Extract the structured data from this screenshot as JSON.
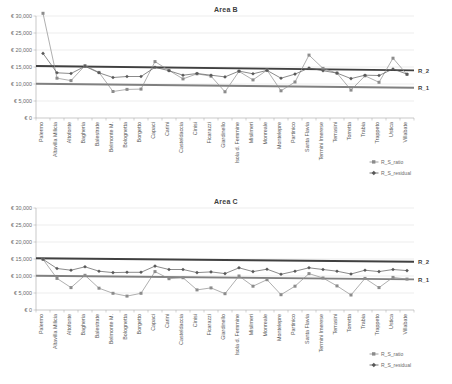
{
  "charts": [
    {
      "title": "Area B",
      "legend": [
        {
          "name": "R_S_ratio",
          "marker": "square-marker-icon",
          "color": "#8c8c8c"
        },
        {
          "name": "R_S_residual",
          "marker": "diamond-marker-icon",
          "color": "#595959"
        }
      ],
      "ref_labels": {
        "upper": "R_2",
        "lower": "R_1"
      }
    },
    {
      "title": "Area C",
      "legend": [
        {
          "name": "R_S_ratio",
          "marker": "square-marker-icon",
          "color": "#8c8c8c"
        },
        {
          "name": "R_S_residual",
          "marker": "diamond-marker-icon",
          "color": "#595959"
        }
      ],
      "ref_labels": {
        "upper": "R_2",
        "lower": "R_1"
      }
    }
  ],
  "chart_data": [
    {
      "type": "line",
      "title": "Area B",
      "xlabel": "",
      "ylabel": "",
      "ylim": [
        0,
        30000
      ],
      "yticks": [
        0,
        5000,
        10000,
        15000,
        20000,
        25000,
        30000
      ],
      "ytick_labels": [
        "€ 0",
        "€ 5,000",
        "€ 10,000",
        "€ 15,000",
        "€ 20,000",
        "€ 25,000",
        "€ 30,000"
      ],
      "grid": true,
      "legend_position": "bottom-right",
      "categories": [
        "Palermo",
        "Altavilla Milicia",
        "Altofonte",
        "Bagheria",
        "Balestrate",
        "Belmonte M.",
        "Bolognetta",
        "Borgetto",
        "Capaci",
        "Carini",
        "Casteldaccia",
        "Cinisi",
        "Ficarazzi",
        "Giardinello",
        "Isola d. Femmine",
        "Misilmeri",
        "Monreale",
        "Montelepre",
        "Partinico",
        "Santa Flavia",
        "Termini Imerese",
        "Terrasini",
        "Torretta",
        "Trabia",
        "Trappeto",
        "Ustica",
        "Villabate"
      ],
      "series": [
        {
          "name": "R_S_ratio",
          "color": "#8c8c8c",
          "values": [
            30800,
            11700,
            11000,
            15400,
            13400,
            7800,
            8400,
            8500,
            16600,
            14000,
            11500,
            13000,
            12300,
            7700,
            13700,
            11200,
            14100,
            8000,
            10600,
            18500,
            14600,
            13200,
            8200,
            12400,
            10500,
            17600,
            12800
          ]
        },
        {
          "name": "R_S_residual",
          "color": "#595959",
          "values": [
            19000,
            13300,
            13100,
            15200,
            13300,
            11900,
            12200,
            12200,
            14900,
            13900,
            12600,
            13100,
            12600,
            12100,
            13800,
            13000,
            14000,
            11700,
            12900,
            14700,
            13900,
            13200,
            11600,
            12600,
            12500,
            14400,
            12900
          ]
        }
      ],
      "reference_lines": [
        {
          "name": "R_2",
          "color": "#404040",
          "start": 15300,
          "end": 14000
        },
        {
          "name": "R_1",
          "color": "#808080",
          "start": 10100,
          "end": 8900
        }
      ]
    },
    {
      "type": "line",
      "title": "Area C",
      "xlabel": "",
      "ylabel": "",
      "ylim": [
        0,
        30000
      ],
      "yticks": [
        0,
        5000,
        10000,
        15000,
        20000,
        25000,
        30000
      ],
      "ytick_labels": [
        "€ 0",
        "€ 5,000",
        "€ 10,000",
        "€ 15,000",
        "€ 20,000",
        "€ 25,000",
        "€ 30,000"
      ],
      "grid": true,
      "legend_position": "bottom-right",
      "categories": [
        "Palermo",
        "Altavilla Milicia",
        "Altofonte",
        "Bagheria",
        "Balestrate",
        "Belmonte M.",
        "Bolognetta",
        "Borgetto",
        "Capaci",
        "Carini",
        "Casteldaccia",
        "Cinisi",
        "Ficarazzi",
        "Giardinello",
        "Isola d. Femmine",
        "Misilmeri",
        "Monreale",
        "Montelepre",
        "Partinico",
        "Santa Flavia",
        "Termini Imerese",
        "Terrasini",
        "Torretta",
        "Trabia",
        "Trappeto",
        "Ustica",
        "Villabate"
      ],
      "series": [
        {
          "name": "R_S_ratio",
          "color": "#8c8c8c",
          "values": [
            14900,
            9300,
            6600,
            10200,
            6400,
            4900,
            4100,
            4900,
            11300,
            9200,
            9500,
            5900,
            6500,
            4800,
            10000,
            7000,
            8900,
            4500,
            7000,
            10700,
            9400,
            7100,
            4400,
            9300,
            6600,
            9600,
            9100
          ]
        },
        {
          "name": "R_S_residual",
          "color": "#595959",
          "values": [
            14900,
            12200,
            11700,
            12700,
            11400,
            11000,
            11100,
            11100,
            12900,
            11900,
            11900,
            11000,
            11200,
            10700,
            12400,
            11300,
            12000,
            10500,
            11400,
            12400,
            11900,
            11400,
            10600,
            11700,
            11300,
            11900,
            11600
          ]
        }
      ],
      "reference_lines": [
        {
          "name": "R_2",
          "color": "#404040",
          "start": 15200,
          "end": 14200
        },
        {
          "name": "R_1",
          "color": "#808080",
          "start": 10100,
          "end": 9000
        }
      ]
    }
  ]
}
